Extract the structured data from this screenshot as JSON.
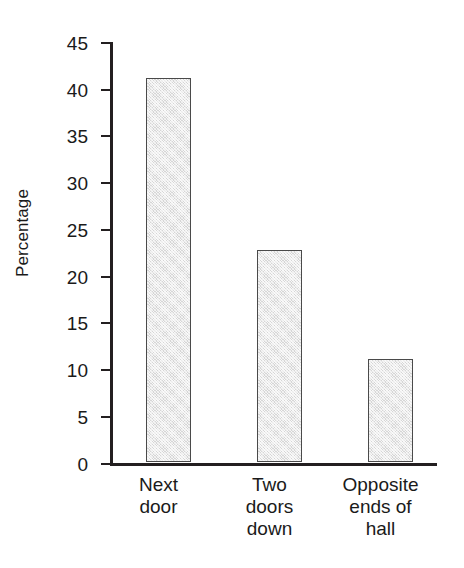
{
  "chart_data": {
    "type": "bar",
    "title": "",
    "xlabel": "",
    "ylabel": "Percentage",
    "categories": [
      "Next door",
      "Two doors down",
      "Opposite ends of hall"
    ],
    "category_lines": [
      [
        "Next",
        "door"
      ],
      [
        "Two",
        "doors",
        "down"
      ],
      [
        "Opposite",
        "ends of",
        "hall"
      ]
    ],
    "values": [
      41,
      22.7,
      11
    ],
    "ylim": [
      0,
      45
    ],
    "yticks": [
      0,
      5,
      10,
      15,
      20,
      25,
      30,
      35,
      40,
      45
    ],
    "ytick_labels": [
      "0",
      "5",
      "10",
      "15",
      "20",
      "25",
      "30",
      "35",
      "40",
      "45"
    ],
    "grid": false,
    "legend": false,
    "bar_fill": "#ebebeb",
    "bar_border": "#4a4a4a",
    "axis_color": "#231f20",
    "background": "#ffffff"
  }
}
